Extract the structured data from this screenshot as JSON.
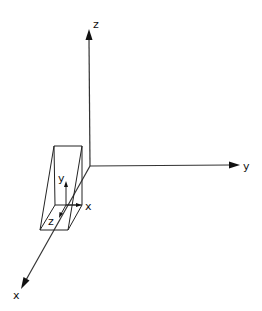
{
  "diagram": {
    "type": "3d-coordinate-frames",
    "colors": {
      "line": "#222222",
      "background": "#ffffff"
    },
    "world_axes": {
      "z": {
        "label": "z"
      },
      "y": {
        "label": "y"
      },
      "x": {
        "label": "x"
      }
    },
    "local_frame": {
      "x": {
        "label": "x"
      },
      "y": {
        "label": "y"
      },
      "z": {
        "label": "z"
      }
    }
  }
}
